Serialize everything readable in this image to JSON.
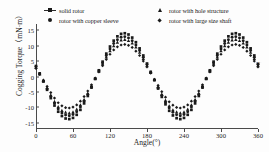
{
  "chart_data": {
    "type": "scatter",
    "title": "",
    "xlabel": "Angle(°)",
    "ylabel": "Cogging Torque（mN·m）",
    "xlim": [
      0,
      360
    ],
    "ylim": [
      -17,
      17
    ],
    "xticks": [
      0,
      60,
      120,
      180,
      240,
      300,
      360
    ],
    "yticks": [
      15,
      10,
      5,
      0,
      -5,
      -10,
      -15
    ],
    "grid": false,
    "legend_position": "top",
    "x": [
      0,
      6,
      12,
      18,
      24,
      30,
      36,
      42,
      48,
      54,
      60,
      66,
      72,
      78,
      84,
      90,
      96,
      102,
      108,
      114,
      120,
      126,
      132,
      138,
      144,
      150,
      156,
      162,
      168,
      174,
      180,
      186,
      192,
      198,
      204,
      210,
      216,
      222,
      228,
      234,
      240,
      246,
      252,
      258,
      264,
      270,
      276,
      282,
      288,
      294,
      300,
      306,
      312,
      318,
      324,
      330,
      336,
      342,
      348,
      354,
      360
    ],
    "series": [
      {
        "name": "solid rotor",
        "marker": "square",
        "values": [
          3.4,
          1.0,
          -1.6,
          -4.3,
          -7.0,
          -9.4,
          -11.4,
          -12.8,
          -13.6,
          -13.8,
          -13.4,
          -12.4,
          -10.8,
          -8.7,
          -6.3,
          -3.6,
          -0.8,
          2.0,
          4.8,
          7.4,
          9.7,
          11.6,
          13.0,
          13.8,
          14.0,
          13.6,
          12.6,
          11.1,
          9.1,
          6.8,
          4.2,
          1.5,
          -1.2,
          -3.9,
          -6.6,
          -9.0,
          -11.1,
          -12.6,
          -13.5,
          -13.8,
          -13.4,
          -12.4,
          -10.8,
          -8.7,
          -6.3,
          -3.6,
          -0.8,
          2.0,
          4.8,
          7.4,
          9.7,
          11.6,
          13.0,
          13.8,
          14.0,
          13.6,
          12.6,
          11.1,
          9.1,
          6.8,
          4.2
        ]
      },
      {
        "name": "rotor with copper sleeve",
        "marker": "circle",
        "values": [
          3.2,
          0.9,
          -1.5,
          -4.0,
          -6.5,
          -8.7,
          -10.5,
          -11.8,
          -12.5,
          -12.7,
          -12.3,
          -11.4,
          -9.9,
          -8.0,
          -5.8,
          -3.3,
          -0.7,
          1.9,
          4.4,
          6.8,
          8.9,
          10.7,
          11.9,
          12.7,
          12.9,
          12.5,
          11.6,
          10.2,
          8.4,
          6.2,
          3.9,
          1.4,
          -1.1,
          -3.6,
          -6.1,
          -8.3,
          -10.2,
          -11.6,
          -12.4,
          -12.7,
          -12.3,
          -11.4,
          -9.9,
          -8.0,
          -5.8,
          -3.3,
          -0.7,
          1.9,
          4.4,
          6.8,
          8.9,
          10.7,
          11.9,
          12.7,
          12.9,
          12.5,
          11.6,
          10.2,
          8.4,
          6.2,
          3.9
        ]
      },
      {
        "name": "rotor with hole structure",
        "marker": "triangle",
        "values": [
          3.0,
          0.8,
          -1.4,
          -3.7,
          -6.0,
          -8.1,
          -9.8,
          -11.0,
          -11.6,
          -11.8,
          -11.5,
          -10.6,
          -9.2,
          -7.5,
          -5.4,
          -3.1,
          -0.6,
          1.7,
          4.1,
          6.3,
          8.3,
          9.9,
          11.1,
          11.8,
          12.0,
          11.6,
          10.8,
          9.5,
          7.8,
          5.8,
          3.6,
          1.3,
          -1.0,
          -3.4,
          -5.7,
          -7.7,
          -9.5,
          -10.8,
          -11.5,
          -11.8,
          -11.5,
          -10.6,
          -9.2,
          -7.5,
          -5.4,
          -3.1,
          -0.6,
          1.7,
          4.1,
          6.3,
          8.3,
          9.9,
          11.1,
          11.8,
          12.0,
          11.6,
          10.8,
          9.5,
          7.8,
          5.8,
          3.6
        ]
      },
      {
        "name": "rotor with large size shaft",
        "marker": "diamond",
        "values": [
          2.6,
          0.7,
          -1.2,
          -3.2,
          -5.2,
          -7.0,
          -8.5,
          -9.5,
          -10.1,
          -10.2,
          -9.9,
          -9.2,
          -8.0,
          -6.5,
          -4.7,
          -2.7,
          -0.5,
          1.5,
          3.5,
          5.5,
          7.2,
          8.6,
          9.6,
          10.2,
          10.4,
          10.1,
          9.4,
          8.2,
          6.8,
          5.0,
          3.1,
          1.1,
          -0.9,
          -2.9,
          -4.9,
          -6.7,
          -8.2,
          -9.3,
          -10.0,
          -10.2,
          -9.9,
          -9.2,
          -8.0,
          -6.5,
          -4.7,
          -2.7,
          -0.5,
          1.5,
          3.5,
          5.5,
          7.2,
          8.6,
          9.6,
          10.2,
          10.4,
          10.1,
          9.4,
          8.2,
          6.8,
          5.0,
          3.1
        ]
      }
    ]
  },
  "legend": {
    "entries": [
      {
        "label": "solid rotor",
        "marker": "square"
      },
      {
        "label": "rotor with copper sleeve",
        "marker": "circle"
      },
      {
        "label": "rotor with hole structure",
        "marker": "triangle"
      },
      {
        "label": "rotor with large size shaft",
        "marker": "diamond"
      }
    ]
  },
  "colors": {
    "series": "#1a1a1a",
    "axis": "#4a4a4a",
    "text": "#1d1d1d",
    "background": "#fdfdfd"
  },
  "watermark": {
    "text": "···"
  }
}
